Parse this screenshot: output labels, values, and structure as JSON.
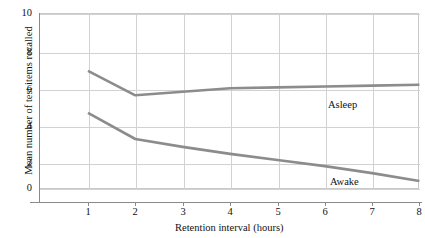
{
  "chart_data": {
    "type": "line",
    "title": "",
    "xlabel": "Retention interval (hours)",
    "ylabel": "Mean number of test items recalled",
    "x": [
      1,
      2,
      3,
      4,
      5,
      6,
      7,
      8
    ],
    "xlim": [
      0.5,
      8
    ],
    "ylim": [
      0,
      10
    ],
    "xticks": [
      "1",
      "2",
      "3",
      "4",
      "5",
      "6",
      "7",
      "8"
    ],
    "yticks": [
      "0",
      "2",
      "4",
      "6",
      "8",
      "10"
    ],
    "grid": true,
    "legend_position": "inline-annotation",
    "series": [
      {
        "name": "Asleep",
        "color": "#8c8c8c",
        "values": [
          6.7,
          5.3,
          5.5,
          5.7,
          5.75,
          5.8,
          5.85,
          5.9
        ],
        "label_x": 6.1,
        "label_y": 5.0
      },
      {
        "name": "Awake",
        "color": "#8c8c8c",
        "values": [
          4.3,
          2.8,
          2.35,
          1.95,
          1.6,
          1.25,
          0.85,
          0.4
        ],
        "label_x": 6.15,
        "label_y": 0.6
      }
    ]
  },
  "colors": {
    "line": "#8c8c8c",
    "grid": "#d2d2d2",
    "axis": "#8a8a8a",
    "text": "#111111",
    "background": "#ffffff"
  }
}
